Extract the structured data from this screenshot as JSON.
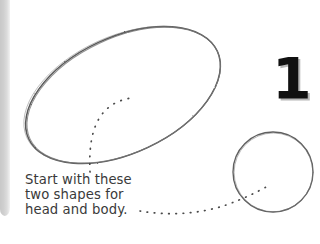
{
  "page": {
    "background_color": "#ffffff",
    "width": 320,
    "height": 244
  },
  "page_edge": {
    "name": "page-edge-shadow",
    "color": "#cfcfcf"
  },
  "step_number": {
    "label": "1",
    "color": "#111111",
    "shadow_color": "#b9b9b9"
  },
  "caption": {
    "lines": [
      "Start with these",
      "two shapes for",
      "head and body."
    ],
    "color": "#3a3a3a"
  },
  "drawing": {
    "stroke_color": "#555555",
    "shapes": [
      {
        "name": "body-ellipse",
        "type": "ellipse",
        "cx": 123,
        "cy": 95,
        "rx": 104,
        "ry": 58,
        "rotation_deg": -25
      },
      {
        "name": "head-circle",
        "type": "circle",
        "cx": 273,
        "cy": 172,
        "r": 40
      }
    ],
    "leaders": [
      {
        "name": "leader-to-body",
        "type": "dotted-curve",
        "from": [
          90,
          172
        ],
        "to": [
          131,
          99
        ]
      },
      {
        "name": "leader-to-head",
        "type": "dotted-curve",
        "from": [
          140,
          212
        ],
        "to": [
          268,
          186
        ]
      }
    ]
  }
}
